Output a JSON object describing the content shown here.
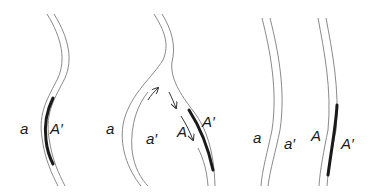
{
  "figure": {
    "colors": {
      "strand": "#8a8a8a",
      "heteroduplex_segment": "#1a1a1a",
      "text": "#1a1a1a"
    },
    "panels": [
      {
        "id": "panel-1",
        "labels": {
          "left": "a",
          "right": "A′"
        }
      },
      {
        "id": "panel-2",
        "labels": {
          "a": "a",
          "a_prime": "a′",
          "A": "A",
          "A_prime": "A′"
        },
        "arrows": [
          "strand-invasion-up",
          "branch-migration-down-1",
          "branch-migration-down-2"
        ]
      },
      {
        "id": "panel-3",
        "labels": {
          "a": "a",
          "a_prime": "a′",
          "A": "A",
          "A_prime": "A′"
        }
      }
    ]
  }
}
